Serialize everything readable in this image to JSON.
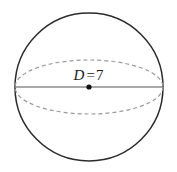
{
  "figure": {
    "kind": "sphere-diagram",
    "background_color": "#ffffff",
    "canvas": {
      "width": 177,
      "height": 172
    },
    "outline": {
      "shape": "circle",
      "center_x": 89,
      "center_y": 87,
      "radius": 74,
      "stroke_color": "#2b2b2b",
      "stroke_width": 1.5,
      "style": "solid",
      "fill": "none"
    },
    "equator": {
      "shape": "ellipse",
      "center_x": 89,
      "center_y": 87,
      "radius_x": 74,
      "radius_y": 27,
      "stroke_color": "#9a9a9a",
      "stroke_width": 1.2,
      "style": "dashed",
      "dash_pattern": "4 3",
      "fill": "none"
    },
    "diameter_line": {
      "x1": 15,
      "y1": 87,
      "x2": 163,
      "y2": 87,
      "stroke_color": "#8c8c8c",
      "stroke_width": 1.3,
      "style": "solid"
    },
    "center_point": {
      "cx": 89,
      "cy": 87,
      "radius": 2.6,
      "fill_color": "#111111"
    },
    "label": {
      "symbol": "D",
      "relation": "=",
      "value": "7",
      "full_text": "D = 7",
      "color": "#1a1a1a",
      "font_size_px": 15,
      "x": 89,
      "y": 76
    }
  }
}
